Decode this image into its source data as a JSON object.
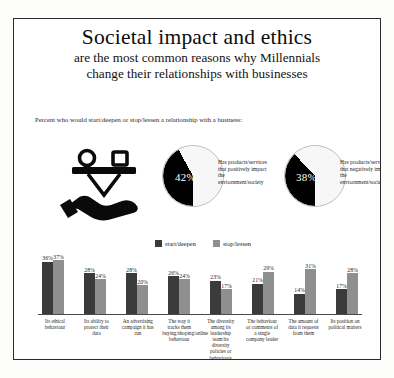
{
  "header": {
    "title_main": "Societal impact and ethics",
    "title_sub_line1": "are the most common reasons why Millennials",
    "title_sub_line2": "change their relationships with businesses",
    "subhead": "Percent who would start/deepen or stop/lessen a relationship with a business:"
  },
  "icon": {
    "scale_icon_name": "hand-holding-balance-scale-icon"
  },
  "pies": [
    {
      "value_label": "42%",
      "value": 42,
      "caption": "Has products/services that positively impact the enviornment/society",
      "slice_color": "#000000",
      "rest_color": "#f7f7f7"
    },
    {
      "value_label": "38%",
      "value": 38,
      "caption": "Has products/services that negatively impact the enviornment/society",
      "slice_color": "#000000",
      "rest_color": "#f7f7f7"
    }
  ],
  "legend": [
    {
      "label": "start/deepen",
      "color": "#3b3b3b"
    },
    {
      "label": "stop/lessen",
      "color": "#8f8f8f"
    }
  ],
  "source": "Source: The Deloitte Global Millennial Survey, 2019",
  "chart_data": {
    "type": "bar",
    "title": "Societal impact and ethics",
    "xlabel": "",
    "ylabel": "",
    "ylim": [
      0,
      40
    ],
    "grid": false,
    "legend_position": "top-center",
    "categories": [
      "Its ethical behaviour",
      "Its ability to protect their data",
      "An advertising campaign it has run",
      "The way it tracks them buying/shoping/online behaviour",
      "The diversity among its leadership team/its diversity policies or behaviours",
      "The behaviour or comments of a single company leader",
      "The amount of data it requests from them",
      "Its position on political matters"
    ],
    "series": [
      {
        "name": "start/deepen",
        "color": "#3b3b3b",
        "values": [
          36,
          28,
          28,
          26,
          23,
          21,
          14,
          17
        ]
      },
      {
        "name": "stop/lessen",
        "color": "#8f8f8f",
        "values": [
          37,
          24,
          20,
          24,
          17,
          29,
          31,
          28
        ]
      }
    ],
    "value_labels": [
      {
        "start_deepen": "36%",
        "stop_lessen": "37%"
      },
      {
        "start_deepen": "28%",
        "stop_lessen": "24%"
      },
      {
        "start_deepen": "28%",
        "stop_lessen": "20%"
      },
      {
        "start_deepen": "26%",
        "stop_lessen": "24%"
      },
      {
        "start_deepen": "23%",
        "stop_lessen": "17%"
      },
      {
        "start_deepen": "21%",
        "stop_lessen": "29%"
      },
      {
        "start_deepen": "14%",
        "stop_lessen": "31%"
      },
      {
        "start_deepen": "17%",
        "stop_lessen": "28%"
      }
    ]
  }
}
